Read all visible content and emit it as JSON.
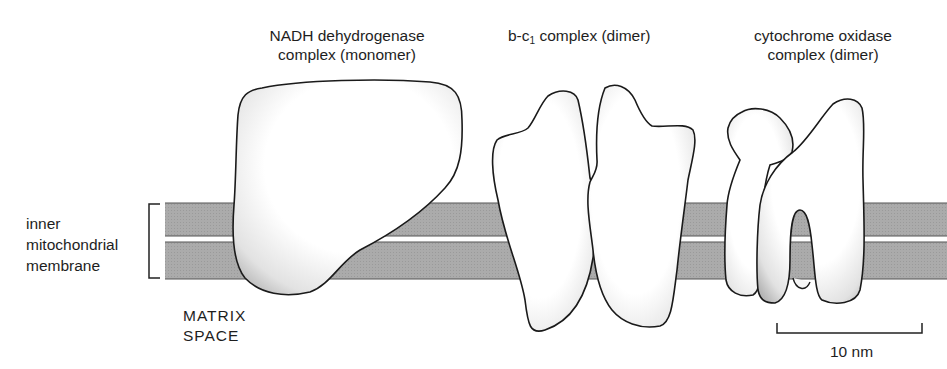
{
  "diagram": {
    "complexes": [
      {
        "id": "nadh",
        "label_line1": "NADH dehydrogenase",
        "label_line2": "complex (monomer)"
      },
      {
        "id": "bc1",
        "label_prefix": "b-c",
        "label_subscript": "1",
        "label_suffix": " complex (dimer)"
      },
      {
        "id": "cox",
        "label_line1": "cytochrome oxidase",
        "label_line2": "complex (dimer)"
      }
    ],
    "membrane": {
      "label_line1": "inner",
      "label_line2": "mitochondrial",
      "label_line3": "membrane",
      "fill_color": "#a9a9a9",
      "edge_color": "#555555"
    },
    "matrix": {
      "label_line1": "MATRIX",
      "label_line2": "SPACE"
    },
    "scale_bar": {
      "label": "10 nm"
    },
    "colors": {
      "protein_fill": "#ffffff",
      "protein_outline": "#1a1a1a",
      "stipple": "#6a6a6a"
    }
  }
}
